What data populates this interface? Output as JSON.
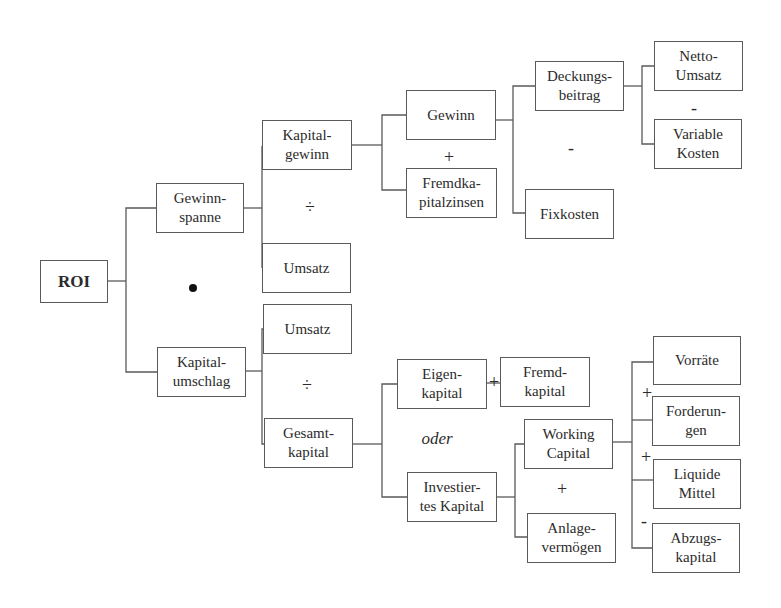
{
  "diagram": {
    "title": "ROI",
    "nodes": {
      "roi": "ROI",
      "gewinnspanne": "Gewinn-\nspanne",
      "kapitalumschlag": "Kapital-\numschlag",
      "kapitalgewinn": "Kapital-\ngewinn",
      "umsatz_top": "Umsatz",
      "umsatz_bottom": "Umsatz",
      "gesamtkapital": "Gesamt-\nkapital",
      "gewinn": "Gewinn",
      "fremdkapitalzinsen": "Fremdka-\npitalzinsen",
      "deckungsbeitrag": "Deckungs-\nbeitrag",
      "fixkosten": "Fixkosten",
      "netto_umsatz": "Netto-\nUmsatz",
      "variable_kosten": "Variable\nKosten",
      "eigenkapital": "Eigen-\nkapital",
      "fremdkapital": "Fremd-\nkapital",
      "working_capital": "Working\nCapital",
      "investiertes_kapital": "Investier-\ntes Kapital",
      "anlagevermoegen": "Anlage-\nvermögen",
      "vorraete": "Vorräte",
      "forderungen": "Forderun-\ngen",
      "liquide_mittel": "Liquide\nMittel",
      "abzugskapital": "Abzugs-\nkapital"
    },
    "operators": {
      "multiply": "•",
      "divide_top": "÷",
      "divide_bottom": "÷",
      "plus_gewinn": "+",
      "minus_deckung": "-",
      "minus_netto": "-",
      "plus_eigen_fremd": "+",
      "oder": "oder",
      "plus_working_anlage": "+",
      "plus_vorraete_forderungen": "+",
      "plus_forderungen_liquide": "+",
      "minus_liquide_abzugs": "-"
    },
    "colors": {
      "line": "#5a5a5a",
      "text": "#2b2b2b",
      "background": "#ffffff"
    }
  }
}
